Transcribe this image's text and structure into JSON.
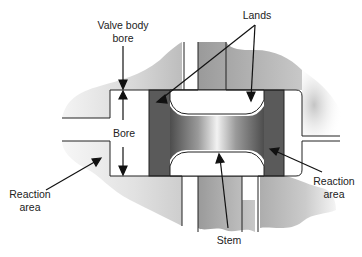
{
  "diagram": {
    "type": "spool-valve-cross-section",
    "labels": {
      "valve_body_bore_line1": "Valve body",
      "valve_body_bore_line2": "bore",
      "lands": "Lands",
      "bore": "Bore",
      "reaction_area_left_line1": "Reaction",
      "reaction_area_left_line2": "area",
      "reaction_area_right_line1": "Reaction",
      "reaction_area_right_line2": "area",
      "stem": "Stem"
    },
    "colors": {
      "body_light": "#e8e8e8",
      "body_dark": "#8a8a8a",
      "land_dark": "#555555",
      "outline": "#222222",
      "background": "#ffffff"
    }
  }
}
